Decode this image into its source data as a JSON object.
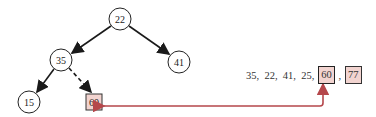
{
  "tree": {
    "nodes": [
      {
        "id": "n22",
        "label": "22",
        "x": 120,
        "y": 19,
        "shape": "circle"
      },
      {
        "id": "n35",
        "label": "35",
        "x": 61,
        "y": 60,
        "shape": "circle"
      },
      {
        "id": "n41",
        "label": "41",
        "x": 179,
        "y": 62,
        "shape": "circle"
      },
      {
        "id": "n15",
        "label": "15",
        "x": 29,
        "y": 102,
        "shape": "circle"
      },
      {
        "id": "n60",
        "label": "60",
        "x": 94,
        "y": 102,
        "shape": "box",
        "highlighted": true
      }
    ],
    "edges": [
      {
        "from": "n22",
        "to": "n35",
        "style": "solid"
      },
      {
        "from": "n22",
        "to": "n41",
        "style": "solid"
      },
      {
        "from": "n35",
        "to": "n15",
        "style": "solid"
      },
      {
        "from": "n35",
        "to": "n60",
        "style": "dashed"
      }
    ]
  },
  "sequence": {
    "plain": "35,  22,  41,  25, ",
    "items": [
      {
        "label": "60",
        "highlighted": true,
        "current": true
      },
      {
        "label": "77",
        "highlighted": true,
        "current": false
      }
    ],
    "separator": " , "
  },
  "link_arrow": {
    "from": "sequence-60",
    "to": "tree-node-60",
    "color": "#b5474b"
  },
  "colors": {
    "highlight_fill": "#f2d4d0",
    "arrow_red": "#b5474b",
    "edge": "#1a1a1a"
  }
}
